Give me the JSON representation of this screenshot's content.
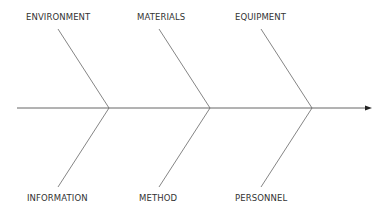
{
  "diagram": {
    "type": "fishbone",
    "line_color": "#555555",
    "text_color": "#333333",
    "categories_top": [
      "ENVIRONMENT",
      "MATERIALS",
      "EQUIPMENT"
    ],
    "categories_bottom": [
      "INFORMATION",
      "METHOD",
      "PERSONNEL"
    ]
  }
}
